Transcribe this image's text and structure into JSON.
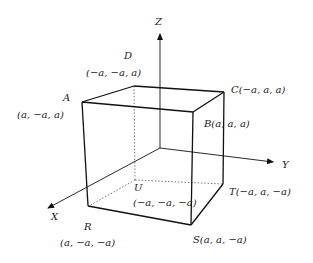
{
  "diagram": {
    "title": "",
    "colors": {
      "edge": "#111111",
      "hidden": "#555555",
      "text": "#222222",
      "background": "#ffffff"
    },
    "axes": [
      {
        "id": "z",
        "label": "Z"
      },
      {
        "id": "y",
        "label": "Y"
      },
      {
        "id": "x",
        "label": "X"
      }
    ],
    "vertices": [
      {
        "id": "A",
        "name": "A",
        "coords": "(a, −a, a)"
      },
      {
        "id": "D",
        "name": "D",
        "coords": "(−a, −a, a)"
      },
      {
        "id": "C",
        "name": "C",
        "coords": "C(−a, a, a)"
      },
      {
        "id": "B",
        "name": "B",
        "coords": "B(a, a, a)"
      },
      {
        "id": "U",
        "name": "U",
        "coords": "(−a, −a, −a)"
      },
      {
        "id": "T",
        "name": "T",
        "coords": "T(−a, a, −a)"
      },
      {
        "id": "S",
        "name": "S",
        "coords": "S(a, a, −a)"
      },
      {
        "id": "R",
        "name": "R",
        "coords": "(a, −a, −a)"
      }
    ]
  }
}
